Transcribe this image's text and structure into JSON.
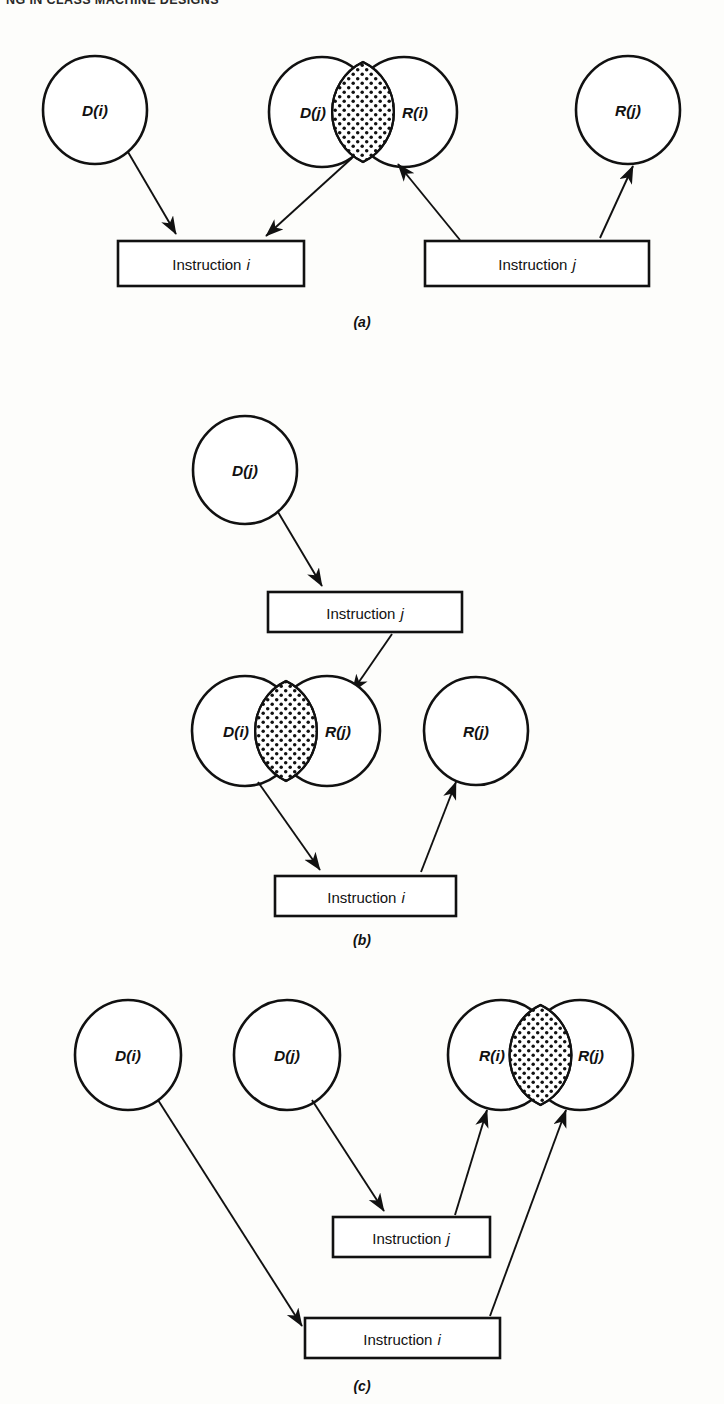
{
  "page": {
    "running_head": "NG IN CLASS MACHINE DESIGNS",
    "background_color": "#fdfdfb",
    "ink_color": "#111111"
  },
  "figure": {
    "type": "dependency-diagram",
    "panels": [
      {
        "id": "a",
        "caption": "(a)",
        "caption_pos": {
          "x": 362,
          "y": 322
        },
        "sets": [
          {
            "name": "set-di",
            "label": "D(i)",
            "cx": 95,
            "cy": 110,
            "r": 52,
            "shaded": false
          },
          {
            "name": "set-dj",
            "label": "D(j)",
            "cx": 322,
            "cy": 112,
            "r": 53,
            "shaded": false
          },
          {
            "name": "set-ri",
            "label": "R(i)",
            "cx": 404,
            "cy": 112,
            "r": 53,
            "shaded": false
          },
          {
            "name": "set-rj",
            "label": "R(j)",
            "cx": 628,
            "cy": 110,
            "r": 52,
            "shaded": false
          }
        ],
        "intersections": [
          {
            "name": "lens-dj-ri",
            "a": "set-dj",
            "b": "set-ri",
            "fill": "stipple"
          }
        ],
        "boxes": [
          {
            "name": "box-instruction-i",
            "label": "Instruction",
            "subscript": "i",
            "x": 118,
            "y": 241,
            "w": 186,
            "h": 45
          },
          {
            "name": "box-instruction-j",
            "label": "Instruction",
            "subscript": "j",
            "x": 425,
            "y": 241,
            "w": 224,
            "h": 45
          }
        ],
        "arrows": [
          {
            "name": "arrow-di-to-instr-i",
            "from": [
              128,
              152
            ],
            "to": [
              176,
              236
            ]
          },
          {
            "name": "arrow-dj-to-instr-i",
            "from": [
              352,
              158
            ],
            "to": [
              262,
              238
            ]
          },
          {
            "name": "arrow-instr-j-to-ri",
            "from": [
              458,
              240
            ],
            "to": [
              398,
              162
            ]
          },
          {
            "name": "arrow-instr-j-to-rj",
            "from": [
              600,
              238
            ],
            "to": [
              634,
              164
            ]
          }
        ]
      },
      {
        "id": "b",
        "caption": "(b)",
        "caption_pos": {
          "x": 362,
          "y": 940
        },
        "sets": [
          {
            "name": "set-dj",
            "label": "D(j)",
            "cx": 245,
            "cy": 470,
            "r": 52,
            "shaded": false
          },
          {
            "name": "set-di",
            "label": "D(i)",
            "cx": 245,
            "cy": 731,
            "r": 53,
            "shaded": false
          },
          {
            "name": "set-rj-over",
            "label": "R(j)",
            "cx": 327,
            "cy": 731,
            "r": 53,
            "shaded": false
          },
          {
            "name": "set-rj",
            "label": "R(j)",
            "cx": 476,
            "cy": 731,
            "r": 52,
            "shaded": false
          }
        ],
        "intersections": [
          {
            "name": "lens-di-rj",
            "a": "set-di",
            "b": "set-rj-over",
            "fill": "stipple"
          }
        ],
        "boxes": [
          {
            "name": "box-instruction-j",
            "label": "Instruction",
            "subscript": "j",
            "x": 268,
            "y": 592,
            "w": 194,
            "h": 40
          },
          {
            "name": "box-instruction-i",
            "label": "Instruction",
            "subscript": "i",
            "x": 275,
            "y": 876,
            "w": 181,
            "h": 40
          }
        ],
        "arrows": [
          {
            "name": "arrow-dj-to-instr-j",
            "from": [
              278,
              512
            ],
            "to": [
              320,
              588
            ]
          },
          {
            "name": "arrow-instr-j-to-rj-over",
            "from": [
              390,
              633
            ],
            "to": [
              352,
              694
            ]
          },
          {
            "name": "arrow-di-to-instr-i",
            "from": [
              258,
              781
            ],
            "to": [
              318,
              872
            ]
          },
          {
            "name": "arrow-instr-i-to-rj",
            "from": [
              421,
              874
            ],
            "to": [
              455,
              780
            ]
          }
        ]
      },
      {
        "id": "c",
        "caption": "(c)",
        "caption_pos": {
          "x": 362,
          "y": 1384
        },
        "sets": [
          {
            "name": "set-di",
            "label": "D(i)",
            "cx": 128,
            "cy": 1055,
            "r": 53,
            "shaded": false
          },
          {
            "name": "set-dj",
            "label": "D(j)",
            "cx": 287,
            "cy": 1055,
            "r": 53,
            "shaded": false
          },
          {
            "name": "set-ri-over",
            "label": "R(i)",
            "cx": 501,
            "cy": 1055,
            "r": 53,
            "shaded": false
          },
          {
            "name": "set-rj-over",
            "label": "R(j)",
            "cx": 580,
            "cy": 1055,
            "r": 53,
            "shaded": false
          }
        ],
        "intersections": [
          {
            "name": "lens-ri-rj",
            "a": "set-ri-over",
            "b": "set-rj-over",
            "fill": "stipple"
          }
        ],
        "boxes": [
          {
            "name": "box-instruction-j",
            "label": "Instruction",
            "subscript": "j",
            "x": 333,
            "y": 1217,
            "w": 157,
            "h": 40
          },
          {
            "name": "box-instruction-i",
            "label": "Instruction",
            "subscript": "i",
            "x": 305,
            "y": 1318,
            "w": 195,
            "h": 40
          }
        ],
        "arrows": [
          {
            "name": "arrow-di-to-instr-i",
            "from": [
              158,
              1100
            ],
            "to": [
              300,
              1324
            ]
          },
          {
            "name": "arrow-dj-to-instr-j",
            "from": [
              312,
              1100
            ],
            "to": [
              383,
              1213
            ]
          },
          {
            "name": "arrow-instr-j-to-ri",
            "from": [
              455,
              1215
            ],
            "to": [
              486,
              1108
            ]
          },
          {
            "name": "arrow-instr-i-to-rj",
            "from": [
              488,
              1316
            ],
            "to": [
              565,
              1108
            ]
          }
        ]
      }
    ]
  }
}
